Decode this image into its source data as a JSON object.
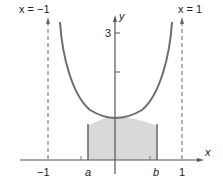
{
  "figure": {
    "function": "y = 1/sqrt(1 - x^2)",
    "asymptote_left_label": "x = −1",
    "asymptote_right_label": "x = 1",
    "x_axis_label": "x",
    "y_axis_label": "y",
    "x_ticks": [
      "−1",
      "a",
      "b",
      "1"
    ],
    "y_ticks": [
      "3"
    ],
    "shaded_region": {
      "from": "a",
      "to": "b"
    },
    "colors": {
      "curve": "#6e6e6e",
      "shade": "#d9d9d9",
      "axis": "#555555",
      "asymptote": "#666666"
    }
  }
}
